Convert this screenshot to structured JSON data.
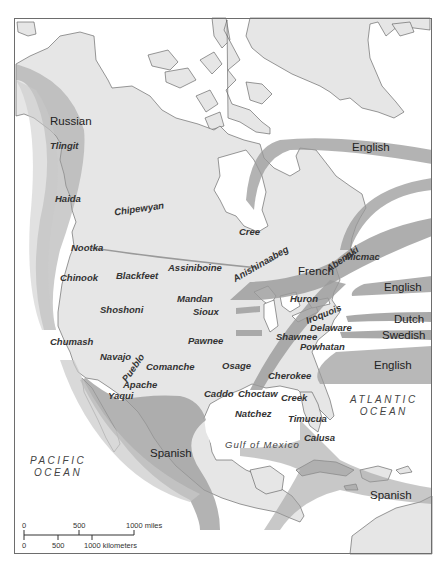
{
  "map": {
    "colors": {
      "land": "#e6e6e6",
      "water": "#ffffff",
      "route_dark": "#9a9a9a",
      "route_light": "#c9c9c9",
      "coast_line": "#555555",
      "frame": "#6d6d6d"
    },
    "colonial_powers": [
      {
        "id": "russian",
        "label": "Russian"
      },
      {
        "id": "english-north",
        "label": "English"
      },
      {
        "id": "french",
        "label": "French"
      },
      {
        "id": "english-mid",
        "label": "English"
      },
      {
        "id": "dutch",
        "label": "Dutch"
      },
      {
        "id": "swedish",
        "label": "Swedish"
      },
      {
        "id": "english-south",
        "label": "English"
      },
      {
        "id": "spanish-west",
        "label": "Spanish"
      },
      {
        "id": "spanish-caribbean",
        "label": "Spanish"
      }
    ],
    "tribes": [
      {
        "id": "tlingit",
        "label": "Tlingit"
      },
      {
        "id": "haida",
        "label": "Haida"
      },
      {
        "id": "chipewyan",
        "label": "Chipewyan"
      },
      {
        "id": "cree",
        "label": "Cree"
      },
      {
        "id": "nootka",
        "label": "Nootka"
      },
      {
        "id": "assiniboine",
        "label": "Assiniboine"
      },
      {
        "id": "micmac",
        "label": "Micmac"
      },
      {
        "id": "chinook",
        "label": "Chinook"
      },
      {
        "id": "blackfeet",
        "label": "Blackfeet"
      },
      {
        "id": "anishinaabeg",
        "label": "Anishinaabeg"
      },
      {
        "id": "abenaki",
        "label": "Abenaki"
      },
      {
        "id": "huron",
        "label": "Huron"
      },
      {
        "id": "iroquois",
        "label": "Iroquois"
      },
      {
        "id": "mandan",
        "label": "Mandan"
      },
      {
        "id": "shoshoni",
        "label": "Shoshoni"
      },
      {
        "id": "sioux",
        "label": "Sioux"
      },
      {
        "id": "delaware",
        "label": "Delaware"
      },
      {
        "id": "shawnee",
        "label": "Shawnee"
      },
      {
        "id": "powhatan",
        "label": "Powhatan"
      },
      {
        "id": "chumash",
        "label": "Chumash"
      },
      {
        "id": "pawnee",
        "label": "Pawnee"
      },
      {
        "id": "navajo",
        "label": "Navajo"
      },
      {
        "id": "pueblo",
        "label": "Pueblo"
      },
      {
        "id": "comanche",
        "label": "Comanche"
      },
      {
        "id": "osage",
        "label": "Osage"
      },
      {
        "id": "cherokee",
        "label": "Cherokee"
      },
      {
        "id": "apache",
        "label": "Apache"
      },
      {
        "id": "yaqui",
        "label": "Yaqui"
      },
      {
        "id": "caddo",
        "label": "Caddo"
      },
      {
        "id": "choctaw",
        "label": "Choctaw"
      },
      {
        "id": "creek",
        "label": "Creek"
      },
      {
        "id": "natchez",
        "label": "Natchez"
      },
      {
        "id": "timucua",
        "label": "Timucua"
      },
      {
        "id": "calusa",
        "label": "Calusa"
      }
    ],
    "water_bodies": {
      "atlantic_line1": "ATLANTIC",
      "atlantic_line2": "OCEAN",
      "pacific_line1": "PACIFIC",
      "pacific_line2": "OCEAN",
      "gulf": "Gulf of Mexico"
    },
    "scale_bar": {
      "miles_ticks": [
        "0",
        "500",
        "1000 miles"
      ],
      "km_ticks": [
        "0",
        "500",
        "1000 kilometers"
      ]
    }
  }
}
